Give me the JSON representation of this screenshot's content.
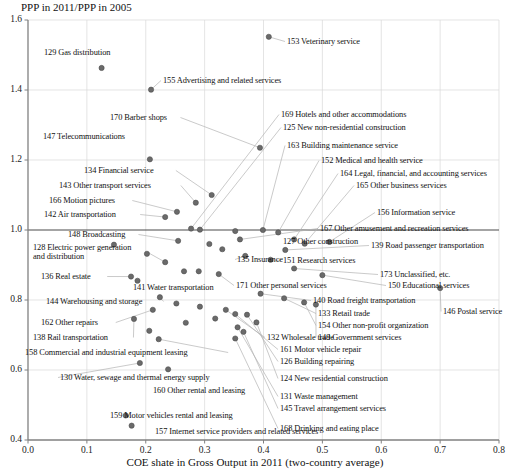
{
  "chart_data": {
    "type": "scatter",
    "title": "",
    "ylabel": "PPP in 2011/PPP in 2005",
    "xlabel": "COE shate in Gross Output in 2011 (two-country average)",
    "xlim": [
      0.0,
      0.8
    ],
    "ylim": [
      0.4,
      1.6
    ],
    "xticks": [
      "0.0",
      "0.1",
      "0.2",
      "0.3",
      "0.4",
      "0.5",
      "0.6",
      "0.7",
      "0.8"
    ],
    "yticks": [
      "0.4",
      "0.6",
      "0.8",
      "1.0",
      "1.2",
      "1.4",
      "1.6"
    ],
    "xtick_values": [
      0.0,
      0.1,
      0.2,
      0.3,
      0.4,
      0.5,
      0.6,
      0.7,
      0.8
    ],
    "ytick_values": [
      0.4,
      0.6,
      0.8,
      1.0,
      1.2,
      1.4,
      1.6
    ],
    "grid": true,
    "legend": "none",
    "reference_line_y": 1.0,
    "marker_color": "#6a6a6a",
    "grid_color": "#d9d9d9",
    "axis_color": "#808080",
    "leader_color": "#b3b3b3",
    "points": [
      {
        "code": "129",
        "name": "129 Gas distribution",
        "x": 0.125,
        "y": 1.463,
        "lx": 44,
        "ly": 48,
        "anchor": "start",
        "leader": false
      },
      {
        "code": "155",
        "name": "155 Advertising and related services",
        "x": 0.209,
        "y": 1.401,
        "lx": 163,
        "ly": 76,
        "anchor": "start",
        "leader": true
      },
      {
        "code": "153",
        "name": "153 Veterinary service",
        "x": 0.409,
        "y": 1.552,
        "lx": 287,
        "ly": 37,
        "anchor": "start",
        "leader": true
      },
      {
        "code": "170",
        "name": "170 Barber shops",
        "x": 0.394,
        "y": 1.235,
        "lx": 110,
        "ly": 113,
        "anchor": "start",
        "leader": true
      },
      {
        "code": "147",
        "name": "147 Telecommunications",
        "x": 0.207,
        "y": 1.202,
        "lx": 43,
        "ly": 132,
        "anchor": "start",
        "leader": false
      },
      {
        "code": "134",
        "name": "134 Financial service",
        "x": 0.312,
        "y": 1.1,
        "lx": 84,
        "ly": 166,
        "anchor": "start",
        "leader": true
      },
      {
        "code": "143",
        "name": "143 Other transport services",
        "x": 0.285,
        "y": 1.078,
        "lx": 59,
        "ly": 181,
        "anchor": "start",
        "leader": true
      },
      {
        "code": "166",
        "name": "166 Motion pictures",
        "x": 0.253,
        "y": 1.052,
        "lx": 49,
        "ly": 196,
        "anchor": "start",
        "leader": true
      },
      {
        "code": "142",
        "name": "142 Air transportation",
        "x": 0.233,
        "y": 1.037,
        "lx": 44,
        "ly": 210,
        "anchor": "start",
        "leader": true
      },
      {
        "code": "169",
        "name": "169 Hotels and other accommodations",
        "x": 0.277,
        "y": 1.004,
        "lx": 281,
        "ly": 110,
        "anchor": "start",
        "leader": true
      },
      {
        "code": "125",
        "name": "125 New non-residential construction",
        "x": 0.292,
        "y": 1.001,
        "lx": 283,
        "ly": 123,
        "anchor": "start",
        "leader": true
      },
      {
        "code": "163",
        "name": "163 Building maintenance service",
        "x": 0.399,
        "y": 1.0,
        "lx": 287,
        "ly": 141,
        "anchor": "start",
        "leader": true
      },
      {
        "code": "152",
        "name": "152 Medical and health service",
        "x": 0.425,
        "y": 0.993,
        "lx": 321,
        "ly": 156,
        "anchor": "start",
        "leader": true
      },
      {
        "code": "164",
        "name": "164 Legal, financial, and accounting services",
        "x": 0.452,
        "y": 0.973,
        "lx": 340,
        "ly": 169,
        "anchor": "start",
        "leader": true
      },
      {
        "code": "165",
        "name": "165 Other business services",
        "x": 0.47,
        "y": 0.961,
        "lx": 356,
        "ly": 181,
        "anchor": "start",
        "leader": true
      },
      {
        "code": "156",
        "name": "156 Information service",
        "x": 0.512,
        "y": 0.966,
        "lx": 377,
        "ly": 208,
        "anchor": "start",
        "leader": true
      },
      {
        "code": "167",
        "name": "167 Other amusement and recreation services",
        "x": 0.36,
        "y": 0.973,
        "lx": 320,
        "ly": 224,
        "anchor": "start",
        "leader": true
      },
      {
        "code": "148",
        "name": "148 Broadcasting",
        "x": 0.255,
        "y": 0.969,
        "lx": 68,
        "ly": 230,
        "anchor": "start",
        "leader": true
      },
      {
        "code": "127",
        "name": "127 Other construction",
        "x": 0.33,
        "y": 0.945,
        "lx": 283,
        "ly": 237,
        "anchor": "start",
        "leader": false
      },
      {
        "code": "139",
        "name": "139 Road passenger transportation",
        "x": 0.437,
        "y": 0.943,
        "lx": 371,
        "ly": 241,
        "anchor": "start",
        "leader": true
      },
      {
        "code": "128",
        "name": "128 Electric power generation and distribution",
        "x": 0.233,
        "y": 0.908,
        "lx": 33,
        "ly": 243,
        "anchor": "start",
        "leader": true,
        "multiline": true
      },
      {
        "code": "135",
        "name": "135 Insurance",
        "x": 0.369,
        "y": 0.926,
        "lx": 237,
        "ly": 255,
        "anchor": "start",
        "leader": true
      },
      {
        "code": "151",
        "name": "151 Research services",
        "x": 0.412,
        "y": 0.915,
        "lx": 283,
        "ly": 256,
        "anchor": "start",
        "leader": true
      },
      {
        "code": "136",
        "name": "136 Real estate",
        "x": 0.175,
        "y": 0.867,
        "lx": 41,
        "ly": 272,
        "anchor": "start",
        "leader": true
      },
      {
        "code": "141",
        "name": "141 Water transportation",
        "x": 0.265,
        "y": 0.882,
        "lx": 133,
        "ly": 283,
        "anchor": "start",
        "leader": false
      },
      {
        "code": "173",
        "name": "173 Unclassified, etc.",
        "x": 0.452,
        "y": 0.89,
        "lx": 380,
        "ly": 270,
        "anchor": "start",
        "leader": true
      },
      {
        "code": "150",
        "name": "150 Educational services",
        "x": 0.5,
        "y": 0.871,
        "lx": 388,
        "ly": 281,
        "anchor": "start",
        "leader": true
      },
      {
        "code": "171",
        "name": "171 Other personal services",
        "x": 0.324,
        "y": 0.874,
        "lx": 236,
        "ly": 281,
        "anchor": "start",
        "leader": true
      },
      {
        "code": "144",
        "name": "144 Warehousing and storage",
        "x": 0.224,
        "y": 0.808,
        "lx": 46,
        "ly": 297,
        "anchor": "start",
        "leader": true
      },
      {
        "code": "140",
        "name": "140 Road freight transportation",
        "x": 0.395,
        "y": 0.818,
        "lx": 313,
        "ly": 296,
        "anchor": "start",
        "leader": true
      },
      {
        "code": "146",
        "name": "146 Postal service",
        "x": 0.7,
        "y": 0.834,
        "lx": 443,
        "ly": 307,
        "anchor": "start",
        "leader": true
      },
      {
        "code": "162",
        "name": "162 Other repairs",
        "x": 0.212,
        "y": 0.772,
        "lx": 41,
        "ly": 318,
        "anchor": "start",
        "leader": true
      },
      {
        "code": "133",
        "name": "133 Retail trade",
        "x": 0.435,
        "y": 0.805,
        "lx": 318,
        "ly": 309,
        "anchor": "start",
        "leader": true
      },
      {
        "code": "154",
        "name": "154 Other non-profit organization",
        "x": 0.469,
        "y": 0.793,
        "lx": 318,
        "ly": 321,
        "anchor": "start",
        "leader": true
      },
      {
        "code": "149",
        "name": "149 Government services",
        "x": 0.489,
        "y": 0.787,
        "lx": 318,
        "ly": 333,
        "anchor": "start",
        "leader": true
      },
      {
        "code": "138",
        "name": "138 Rail transportation",
        "x": 0.18,
        "y": 0.746,
        "lx": 33,
        "ly": 333,
        "anchor": "start",
        "leader": true
      },
      {
        "code": "132",
        "name": "132 Wholesale trade",
        "x": 0.336,
        "y": 0.772,
        "lx": 267,
        "ly": 333,
        "anchor": "start",
        "leader": true
      },
      {
        "code": "161",
        "name": "161 Motor vehicle repair",
        "x": 0.352,
        "y": 0.76,
        "lx": 280,
        "ly": 345,
        "anchor": "start",
        "leader": true
      },
      {
        "code": "158",
        "name": "158 Commercial and industrial equipment leasing",
        "x": 0.222,
        "y": 0.688,
        "lx": 25,
        "ly": 348,
        "anchor": "start",
        "leader": true
      },
      {
        "code": "126",
        "name": "126 Building repairing",
        "x": 0.372,
        "y": 0.758,
        "lx": 280,
        "ly": 357,
        "anchor": "start",
        "leader": true
      },
      {
        "code": "130",
        "name": "130 Water, sewage and thermal energy supply",
        "x": 0.19,
        "y": 0.62,
        "lx": 60,
        "ly": 373,
        "anchor": "start",
        "leader": true
      },
      {
        "code": "124",
        "name": "124 New residential construction",
        "x": 0.388,
        "y": 0.736,
        "lx": 280,
        "ly": 374,
        "anchor": "start",
        "leader": true
      },
      {
        "code": "160",
        "name": "160 Other rental and leasing",
        "x": 0.238,
        "y": 0.602,
        "lx": 153,
        "ly": 386,
        "anchor": "start",
        "leader": false
      },
      {
        "code": "131",
        "name": "131 Waste management",
        "x": 0.356,
        "y": 0.722,
        "lx": 280,
        "ly": 392,
        "anchor": "start",
        "leader": true
      },
      {
        "code": "145",
        "name": "145 Travel arrangement services",
        "x": 0.366,
        "y": 0.709,
        "lx": 280,
        "ly": 404,
        "anchor": "start",
        "leader": true
      },
      {
        "code": "159",
        "name": "159 Motor vehicles rental and leasing",
        "x": 0.166,
        "y": 0.47,
        "lx": 110,
        "ly": 411,
        "anchor": "start",
        "leader": false
      },
      {
        "code": "157",
        "name": "157 Internet service providers and related services",
        "x": 0.176,
        "y": 0.441,
        "lx": 155,
        "ly": 427,
        "anchor": "start",
        "leader": false
      },
      {
        "code": "168",
        "name": "168 Drinking and eating place",
        "x": 0.352,
        "y": 0.69,
        "lx": 280,
        "ly": 424,
        "anchor": "start",
        "leader": true
      }
    ],
    "extra_points": [
      {
        "x": 0.146,
        "y": 0.958
      },
      {
        "x": 0.202,
        "y": 0.932
      },
      {
        "x": 0.308,
        "y": 0.96
      },
      {
        "x": 0.352,
        "y": 0.997
      },
      {
        "x": 0.29,
        "y": 0.882
      },
      {
        "x": 0.186,
        "y": 0.855
      },
      {
        "x": 0.252,
        "y": 0.79
      },
      {
        "x": 0.292,
        "y": 0.781
      },
      {
        "x": 0.268,
        "y": 0.735
      },
      {
        "x": 0.318,
        "y": 0.747
      },
      {
        "x": 0.206,
        "y": 0.712
      }
    ]
  }
}
